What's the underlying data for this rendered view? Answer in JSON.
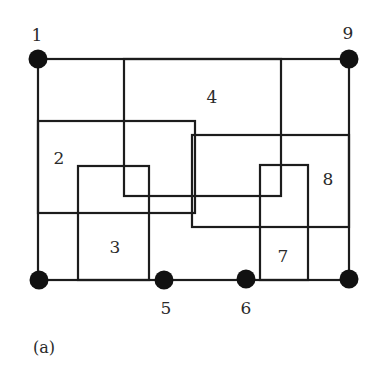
{
  "diagram": {
    "caption": "(a)",
    "outer_frame": {
      "x1": 38,
      "y1": 59,
      "x2": 349,
      "y2": 280
    },
    "regions": [
      {
        "id": "2",
        "label": "2",
        "rect": {
          "x1": 38,
          "y1": 121,
          "x2": 195,
          "y2": 213
        },
        "label_pos": {
          "x": 59,
          "y": 164
        }
      },
      {
        "id": "3",
        "label": "3",
        "rect": {
          "x1": 78,
          "y1": 166,
          "x2": 149,
          "y2": 280
        },
        "label_pos": {
          "x": 115,
          "y": 253
        }
      },
      {
        "id": "4",
        "label": "4",
        "rect": {
          "x1": 124,
          "y1": 59,
          "x2": 281,
          "y2": 196
        },
        "label_pos": {
          "x": 212,
          "y": 103
        }
      },
      {
        "id": "7",
        "label": "7",
        "rect": {
          "x1": 260,
          "y1": 165,
          "x2": 308,
          "y2": 280
        },
        "label_pos": {
          "x": 283,
          "y": 262
        }
      },
      {
        "id": "8",
        "label": "8",
        "rect": {
          "x1": 192,
          "y1": 135,
          "x2": 349,
          "y2": 227
        },
        "label_pos": {
          "x": 328,
          "y": 185
        }
      }
    ],
    "nodes": [
      {
        "id": "1",
        "label": "1",
        "x": 38,
        "y": 59,
        "label_pos": {
          "x": 37,
          "y": 41
        }
      },
      {
        "id": "9",
        "label": "9",
        "x": 349,
        "y": 59,
        "label_pos": {
          "x": 348,
          "y": 39
        }
      },
      {
        "id": "bl",
        "label": "",
        "x": 39,
        "y": 280,
        "label_pos": null
      },
      {
        "id": "5",
        "label": "5",
        "x": 164,
        "y": 280,
        "label_pos": {
          "x": 166,
          "y": 314
        }
      },
      {
        "id": "6",
        "label": "6",
        "x": 246,
        "y": 279,
        "label_pos": {
          "x": 246,
          "y": 314
        }
      },
      {
        "id": "br",
        "label": "",
        "x": 349,
        "y": 279,
        "label_pos": null
      }
    ],
    "colors": {
      "stroke": "#1c1c1c",
      "node": "#111111",
      "text": "#2a2a2a",
      "background": "#ffffff"
    }
  }
}
